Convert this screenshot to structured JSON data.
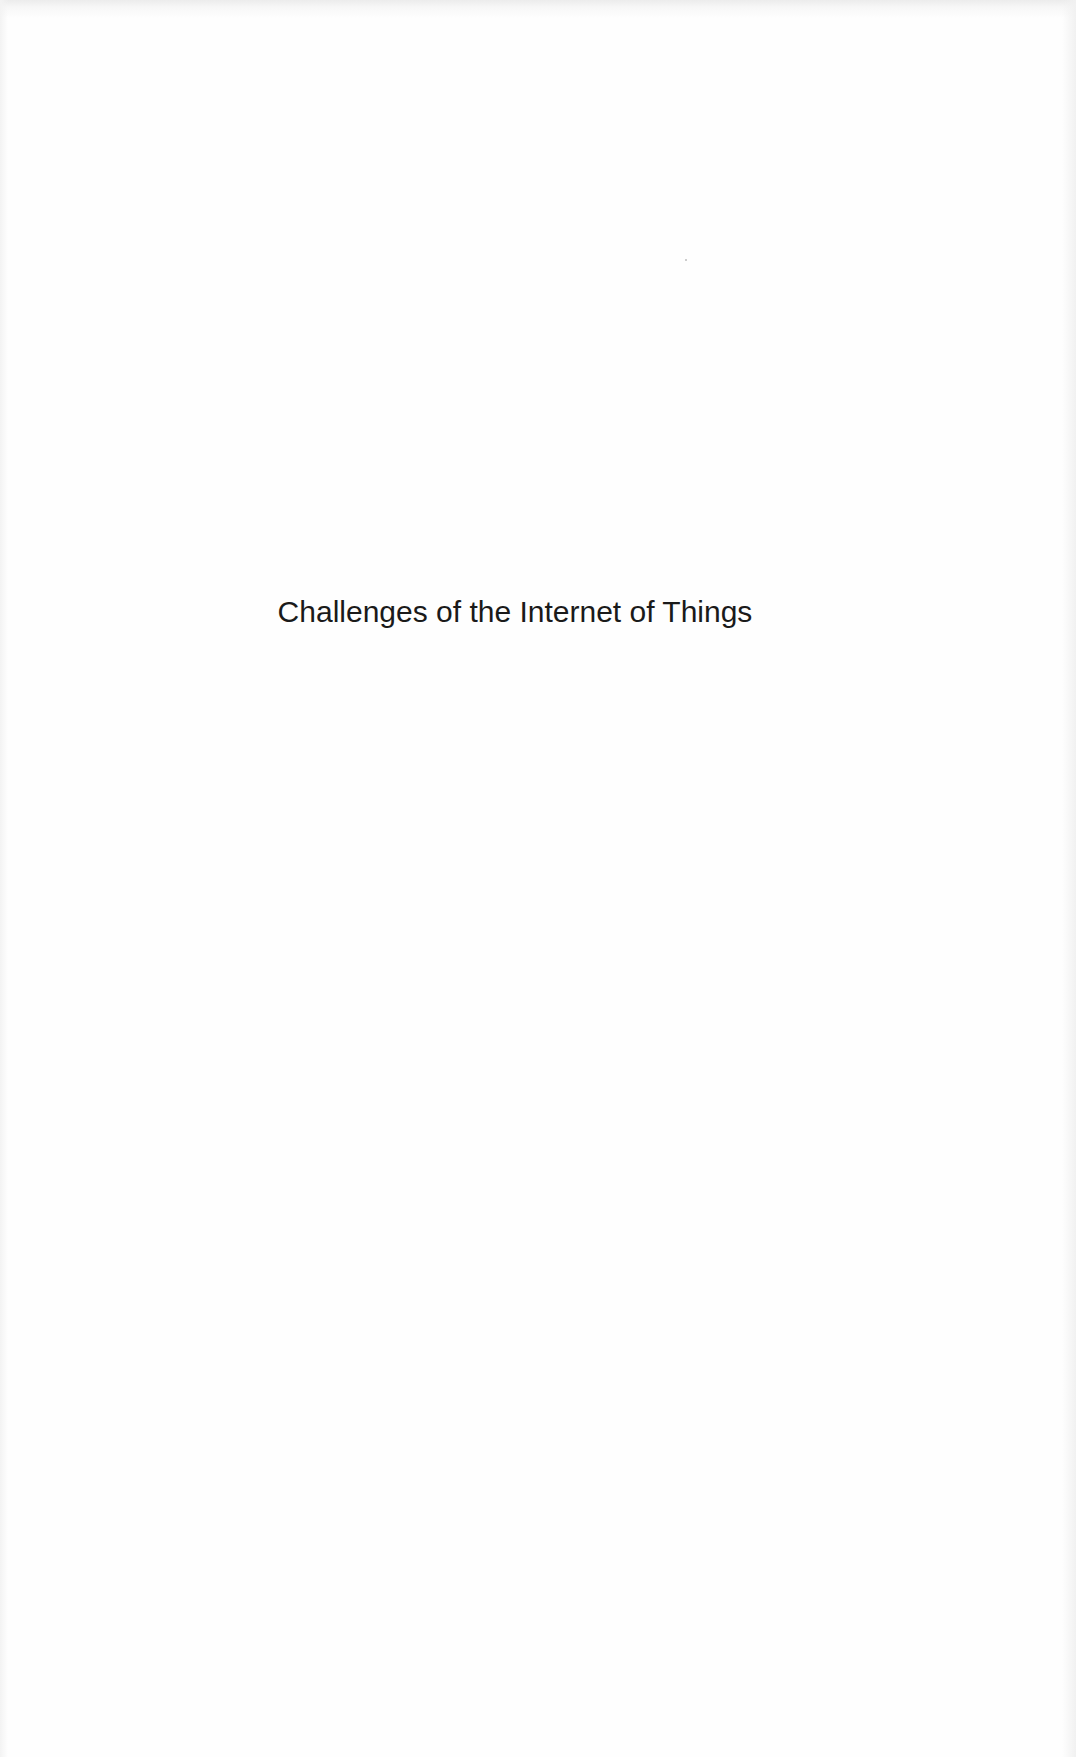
{
  "page": {
    "type": "half-title page",
    "title": "Challenges of the Internet of Things",
    "background_color": "#fefefe",
    "text_color": "#1a1a1a"
  }
}
